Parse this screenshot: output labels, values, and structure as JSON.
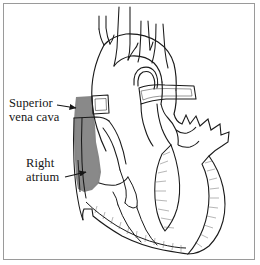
{
  "figure": {
    "type": "anatomical-line-drawing",
    "background_color": "#ffffff",
    "border_color": "#9a9a9a",
    "ink_color": "#1a1a1a",
    "highlight_color": "#7e7e7e",
    "width": 260,
    "height": 265
  },
  "labels": [
    {
      "id": "superior-vena-cava",
      "line1": "Superior",
      "line2": "vena cava",
      "pointer": "arrow",
      "pointer_direction": "right"
    },
    {
      "id": "right-atrium",
      "line1": "Right",
      "line2": "atrium",
      "pointer": "arrow",
      "pointer_direction": "right"
    }
  ],
  "highlighted_structures": [
    "superior vena cava",
    "right atrium"
  ]
}
